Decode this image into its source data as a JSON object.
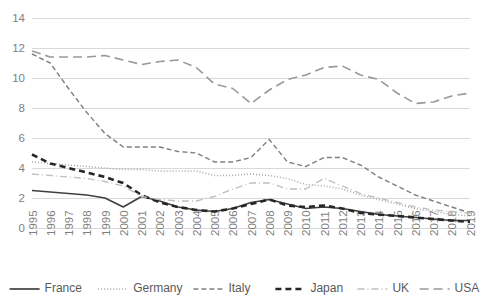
{
  "chart_data": {
    "type": "line",
    "title": "",
    "subtitle": "",
    "xlabel": "",
    "ylabel": "",
    "ylim": [
      0,
      14
    ],
    "yticks": [
      0,
      2,
      4,
      6,
      8,
      10,
      12,
      14
    ],
    "ytick_labels": [
      "0",
      "2",
      "4",
      "6",
      "8",
      "10",
      "12",
      "14"
    ],
    "grid": true,
    "legend_position": "bottom",
    "categories": [
      "1995",
      "1996",
      "1997",
      "1998",
      "1999",
      "2000",
      "2001",
      "2002",
      "2003",
      "2004",
      "2005",
      "2006",
      "2007",
      "2008",
      "2009",
      "2010",
      "2011",
      "2012",
      "2013",
      "2014",
      "2015",
      "2016",
      "2017",
      "2018",
      "2019"
    ],
    "series": [
      {
        "name": "France",
        "color": "#404040",
        "line_style": "solid",
        "values": [
          2.5,
          2.4,
          2.3,
          2.2,
          2.0,
          1.4,
          2.1,
          1.8,
          1.4,
          1.2,
          1.1,
          1.3,
          1.7,
          1.9,
          1.6,
          1.3,
          1.4,
          1.3,
          1.1,
          0.9,
          0.8,
          0.7,
          0.6,
          0.5,
          0.5
        ]
      },
      {
        "name": "Germany",
        "color": "#a6a6a6",
        "line_style": "dotted",
        "values": [
          4.4,
          4.3,
          4.2,
          4.1,
          4.0,
          3.9,
          3.9,
          3.8,
          3.8,
          3.8,
          3.5,
          3.5,
          3.6,
          3.5,
          3.3,
          2.9,
          2.8,
          2.6,
          2.2,
          1.9,
          1.6,
          1.3,
          1.1,
          0.9,
          0.8
        ]
      },
      {
        "name": "Italy",
        "color": "#7f7f7f",
        "line_style": "dashed",
        "values": [
          11.6,
          11.0,
          9.3,
          7.7,
          6.3,
          5.4,
          5.4,
          5.4,
          5.1,
          5.0,
          4.4,
          4.4,
          4.7,
          5.9,
          4.4,
          4.1,
          4.7,
          4.7,
          4.2,
          3.4,
          2.8,
          2.2,
          1.8,
          1.4,
          1.0
        ]
      },
      {
        "name": "Japan",
        "color": "#262626",
        "line_style": "bold-dashed",
        "values": [
          4.9,
          4.3,
          4.0,
          3.7,
          3.4,
          3.0,
          2.2,
          1.7,
          1.4,
          1.2,
          1.1,
          1.3,
          1.6,
          1.9,
          1.5,
          1.4,
          1.5,
          1.3,
          1.0,
          0.9,
          0.8,
          0.7,
          0.6,
          0.5,
          0.4
        ]
      },
      {
        "name": "UK",
        "color": "#bfbfbf",
        "line_style": "dash-dot",
        "values": [
          3.6,
          3.5,
          3.4,
          3.3,
          3.1,
          2.8,
          2.1,
          1.9,
          1.8,
          1.8,
          2.1,
          2.6,
          3.0,
          3.0,
          2.6,
          2.6,
          3.3,
          2.8,
          2.3,
          2.0,
          1.7,
          1.4,
          1.2,
          1.1,
          1.0
        ]
      },
      {
        "name": "USA",
        "color": "#999999",
        "line_style": "long-dash",
        "values": [
          11.8,
          11.4,
          11.4,
          11.4,
          11.5,
          11.2,
          10.9,
          11.1,
          11.2,
          10.7,
          9.6,
          9.3,
          8.3,
          9.2,
          9.9,
          10.2,
          10.7,
          10.8,
          10.2,
          9.9,
          9.0,
          8.3,
          8.4,
          8.8,
          9.0
        ]
      }
    ]
  },
  "axis": {
    "y_ticks": [
      "0",
      "2",
      "4",
      "6",
      "8",
      "10",
      "12",
      "14"
    ],
    "x_ticks": [
      "1995",
      "1996",
      "1997",
      "1998",
      "1999",
      "2000",
      "2001",
      "2002",
      "2003",
      "2004",
      "2005",
      "2006",
      "2007",
      "2008",
      "2009",
      "2010",
      "2011",
      "2012",
      "2013",
      "2014",
      "2015",
      "2016",
      "2017",
      "2018",
      "2019"
    ]
  },
  "legend": {
    "items": [
      {
        "label": "France"
      },
      {
        "label": "Germany"
      },
      {
        "label": "Italy"
      },
      {
        "label": "Japan"
      },
      {
        "label": "UK"
      },
      {
        "label": "USA"
      }
    ]
  }
}
